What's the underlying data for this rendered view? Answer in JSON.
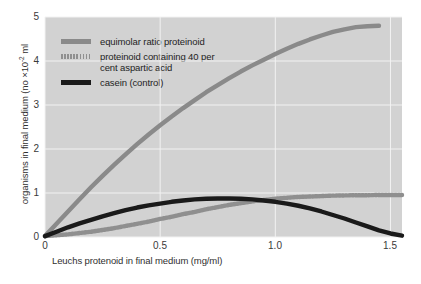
{
  "chart_data": {
    "type": "line",
    "title": "",
    "subtitle": "",
    "xlabel": "Leuchs protenoid in final medium (mg/ml)",
    "ylabel_main": "organisms in final medium (no ×10",
    "ylabel_exponent": "-2",
    "ylabel_suffix": " ml",
    "ylabel_full": "organisms in final medium (no ×10⁻² ml",
    "xlim": [
      0,
      1.55
    ],
    "ylim": [
      0,
      5
    ],
    "xticks": [
      0,
      0.5,
      1.0,
      1.5
    ],
    "xticklabels": [
      "0",
      "0.5",
      "1.0",
      "1.5"
    ],
    "yticks": [
      0,
      1,
      2,
      3,
      4,
      5
    ],
    "yticklabels": [
      "0",
      "1",
      "2",
      "3",
      "4",
      "5"
    ],
    "grid": true,
    "grid_color": "#f2f2f2",
    "plot_background": "#d2d2d2",
    "page_background": "#ffffff",
    "legend_position": "upper left",
    "series": [
      {
        "name": "equimolar ratio proteinoid",
        "color": "#8a8a8a",
        "style": "solid",
        "linewidth": 4.4,
        "x": [
          0.0,
          0.05,
          0.1,
          0.15,
          0.2,
          0.25,
          0.3,
          0.35,
          0.4,
          0.45,
          0.5,
          0.55,
          0.6,
          0.65,
          0.7,
          0.75,
          0.8,
          0.85,
          0.9,
          0.95,
          1.0,
          1.05,
          1.1,
          1.15,
          1.2,
          1.25,
          1.3,
          1.35,
          1.4,
          1.45
        ],
        "values": [
          0.02,
          0.3,
          0.58,
          0.86,
          1.13,
          1.39,
          1.64,
          1.88,
          2.11,
          2.33,
          2.54,
          2.74,
          2.93,
          3.11,
          3.29,
          3.45,
          3.61,
          3.76,
          3.9,
          4.03,
          4.16,
          4.28,
          4.39,
          4.49,
          4.58,
          4.66,
          4.72,
          4.77,
          4.79,
          4.8
        ]
      },
      {
        "name": "proteinoid containing 40 per cent aspartic acid",
        "color": "#8f8f8f",
        "style": "dashed",
        "linewidth": 4.4,
        "x": [
          0.0,
          0.05,
          0.1,
          0.15,
          0.2,
          0.25,
          0.3,
          0.35,
          0.4,
          0.45,
          0.5,
          0.55,
          0.6,
          0.65,
          0.7,
          0.75,
          0.8,
          0.85,
          0.9,
          0.95,
          1.0,
          1.05,
          1.1,
          1.15,
          1.2,
          1.25,
          1.3,
          1.35,
          1.4,
          1.45,
          1.5,
          1.55
        ],
        "values": [
          0.02,
          0.04,
          0.06,
          0.09,
          0.12,
          0.16,
          0.2,
          0.25,
          0.3,
          0.35,
          0.41,
          0.46,
          0.52,
          0.57,
          0.63,
          0.68,
          0.73,
          0.77,
          0.81,
          0.84,
          0.87,
          0.89,
          0.91,
          0.92,
          0.93,
          0.94,
          0.945,
          0.95,
          0.95,
          0.955,
          0.955,
          0.955
        ]
      },
      {
        "name": "casein (control)",
        "color": "#1a1a1a",
        "style": "solid",
        "linewidth": 4.4,
        "x": [
          0.0,
          0.05,
          0.1,
          0.15,
          0.2,
          0.25,
          0.3,
          0.35,
          0.4,
          0.45,
          0.5,
          0.55,
          0.6,
          0.65,
          0.7,
          0.75,
          0.8,
          0.85,
          0.9,
          0.95,
          1.0,
          1.05,
          1.1,
          1.15,
          1.2,
          1.25,
          1.3,
          1.35,
          1.4,
          1.45,
          1.5,
          1.55
        ],
        "values": [
          0.02,
          0.12,
          0.22,
          0.31,
          0.39,
          0.47,
          0.54,
          0.61,
          0.67,
          0.72,
          0.76,
          0.8,
          0.83,
          0.855,
          0.87,
          0.875,
          0.875,
          0.87,
          0.855,
          0.83,
          0.8,
          0.76,
          0.71,
          0.65,
          0.58,
          0.5,
          0.42,
          0.33,
          0.24,
          0.15,
          0.08,
          0.03
        ]
      }
    ]
  },
  "legend": {
    "items": [
      {
        "label": "equimolar ratio proteinoid",
        "swatch": "solid-gray"
      },
      {
        "label": "proteinoid containing 40 per\ncent aspartic acid",
        "swatch": "dashed-gray"
      },
      {
        "label": "casein (control)",
        "swatch": "solid-black"
      }
    ]
  }
}
